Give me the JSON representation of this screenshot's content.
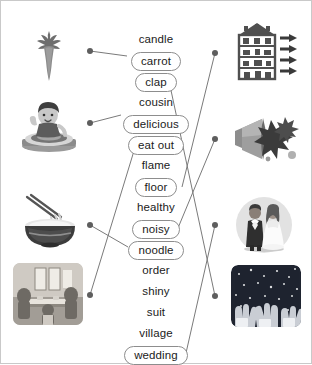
{
  "activity": {
    "type": "matching-exercise",
    "title": "",
    "accent_color": "#6f6f6f",
    "line_color": "#7a7a7a",
    "dot_color": "#5e5e5e",
    "pill_border_color": "#8d8d8d",
    "text_color": "#1b1b1b",
    "background": "#ffffff",
    "frame_color": "#c9c9c9"
  },
  "words": [
    {
      "label": "candle",
      "boxed": false,
      "x": 156,
      "y": 37,
      "matched": false
    },
    {
      "label": "carrot",
      "boxed": true,
      "x": 156,
      "y": 58,
      "matched": true
    },
    {
      "label": "clap",
      "boxed": true,
      "x": 156,
      "y": 79,
      "matched": true
    },
    {
      "label": "cousin",
      "boxed": false,
      "x": 156,
      "y": 100,
      "matched": false
    },
    {
      "label": "delicious",
      "boxed": true,
      "x": 156,
      "y": 121,
      "matched": true
    },
    {
      "label": "eat out",
      "boxed": true,
      "x": 156,
      "y": 142,
      "matched": true
    },
    {
      "label": "flame",
      "boxed": false,
      "x": 156,
      "y": 163,
      "matched": false
    },
    {
      "label": "floor",
      "boxed": true,
      "x": 156,
      "y": 184,
      "matched": true
    },
    {
      "label": "healthy",
      "boxed": false,
      "x": 156,
      "y": 205,
      "matched": false
    },
    {
      "label": "noisy",
      "boxed": true,
      "x": 156,
      "y": 226,
      "matched": true
    },
    {
      "label": "noodle",
      "boxed": true,
      "x": 156,
      "y": 247,
      "matched": true
    },
    {
      "label": "order",
      "boxed": false,
      "x": 156,
      "y": 268,
      "matched": false
    },
    {
      "label": "shiny",
      "boxed": false,
      "x": 156,
      "y": 289,
      "matched": false
    },
    {
      "label": "suit",
      "boxed": false,
      "x": 156,
      "y": 310,
      "matched": false
    },
    {
      "label": "village",
      "boxed": false,
      "x": 156,
      "y": 331,
      "matched": false
    },
    {
      "label": "wedding",
      "boxed": true,
      "x": 156,
      "y": 352,
      "matched": true
    }
  ],
  "left_images": [
    {
      "name": "carrot-image",
      "alt": "carrot",
      "dot_x": 89,
      "dot_y": 50,
      "word": "carrot"
    },
    {
      "name": "child-eating-image",
      "alt": "child eating a meal",
      "dot_x": 89,
      "dot_y": 122,
      "word": "delicious"
    },
    {
      "name": "noodle-bowl-image",
      "alt": "bowl of noodles with chopsticks",
      "dot_x": 89,
      "dot_y": 224,
      "word": "noodle"
    },
    {
      "name": "restaurant-image",
      "alt": "family eating out at a restaurant",
      "dot_x": 89,
      "dot_y": 294,
      "word": "eat out"
    }
  ],
  "right_images": [
    {
      "name": "house-floors-image",
      "alt": "house cutaway with arrows pointing at each floor",
      "dot_x": 214,
      "dot_y": 52,
      "word": "floor"
    },
    {
      "name": "megaphone-noise-image",
      "alt": "megaphone making a loud noise",
      "dot_x": 214,
      "dot_y": 138,
      "word": "noisy"
    },
    {
      "name": "wedding-couple-image",
      "alt": "bride and groom wedding couple",
      "dot_x": 214,
      "dot_y": 224,
      "word": "wedding"
    },
    {
      "name": "applause-image",
      "alt": "audience clapping hands",
      "dot_x": 214,
      "dot_y": 295,
      "word": "clap"
    }
  ],
  "connections": [
    {
      "word": "carrot",
      "side": "left",
      "from_x": 89,
      "from_y": 50,
      "to_x": 126,
      "to_y": 55
    },
    {
      "word": "delicious",
      "side": "left",
      "from_x": 89,
      "from_y": 122,
      "to_x": 120,
      "to_y": 114
    },
    {
      "word": "noodle",
      "side": "left",
      "from_x": 89,
      "from_y": 224,
      "to_x": 127,
      "to_y": 246
    },
    {
      "word": "eat out",
      "side": "left",
      "from_x": 89,
      "from_y": 294,
      "to_x": 136,
      "to_y": 140
    },
    {
      "word": "floor",
      "side": "right",
      "from_x": 214,
      "from_y": 52,
      "to_x": 181,
      "to_y": 186
    },
    {
      "word": "noisy",
      "side": "right",
      "from_x": 214,
      "from_y": 138,
      "to_x": 177,
      "to_y": 227
    },
    {
      "word": "wedding",
      "side": "right",
      "from_x": 214,
      "from_y": 224,
      "to_x": 185,
      "to_y": 352
    },
    {
      "word": "clap",
      "side": "right",
      "from_x": 214,
      "from_y": 295,
      "to_x": 168,
      "to_y": 80
    }
  ]
}
